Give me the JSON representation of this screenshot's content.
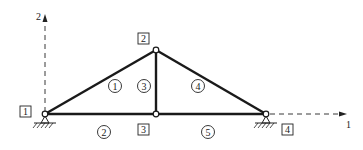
{
  "axes": {
    "y_label": "2",
    "x_label": "1"
  },
  "nodes": [
    {
      "id": "1",
      "x": 45,
      "y": 114,
      "box_x": 20,
      "box_y": 106
    },
    {
      "id": "2",
      "x": 156,
      "y": 50,
      "box_x": 138,
      "box_y": 33
    },
    {
      "id": "3",
      "x": 156,
      "y": 114,
      "box_x": 138,
      "box_y": 124
    },
    {
      "id": "4",
      "x": 266,
      "y": 114,
      "box_x": 282,
      "box_y": 124
    }
  ],
  "elements": [
    {
      "id": "1",
      "from": "1",
      "to": "2",
      "cx": 115,
      "cy": 86
    },
    {
      "id": "2",
      "from": "1",
      "to": "3",
      "cx": 104,
      "cy": 132
    },
    {
      "id": "3",
      "from": "3",
      "to": "2",
      "cx": 144,
      "cy": 86
    },
    {
      "id": "4",
      "from": "2",
      "to": "4",
      "cx": 198,
      "cy": 86
    },
    {
      "id": "5",
      "from": "3",
      "to": "4",
      "cx": 208,
      "cy": 132
    }
  ],
  "supports": [
    {
      "node": "1",
      "type": "pin"
    },
    {
      "node": "4",
      "type": "pin"
    }
  ]
}
